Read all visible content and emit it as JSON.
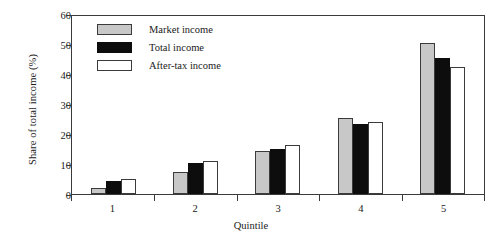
{
  "chart_data": {
    "type": "bar",
    "title": "",
    "xlabel": "Quintile",
    "ylabel": "Share of total income (%)",
    "categories": [
      "1",
      "2",
      "3",
      "4",
      "5"
    ],
    "series": [
      {
        "name": "Market income",
        "color": "#c8c8c8",
        "values": [
          2.0,
          7.3,
          14.5,
          25.5,
          50.3
        ]
      },
      {
        "name": "Total income",
        "color": "#0d0d0d",
        "values": [
          4.5,
          10.3,
          15.0,
          23.5,
          45.5
        ]
      },
      {
        "name": "After-tax income",
        "color": "#ffffff",
        "values": [
          5.0,
          11.0,
          16.2,
          24.0,
          42.5
        ]
      }
    ],
    "ylim": [
      0,
      60
    ],
    "yticks": [
      "0",
      "10",
      "20",
      "30",
      "40",
      "50",
      "60"
    ],
    "grid": false,
    "legend_position": "top-left-inside"
  },
  "axes": {
    "y_title": "Share of total income (%)",
    "x_title": "Quintile",
    "y_tick_labels": [
      "60",
      "50",
      "40",
      "30",
      "20",
      "10",
      "0"
    ],
    "x_tick_labels": [
      "1",
      "2",
      "3",
      "4",
      "5"
    ]
  },
  "legend": {
    "items": [
      {
        "label": "Market income",
        "swatch": "gray-swatch"
      },
      {
        "label": "Total income",
        "swatch": "black-swatch"
      },
      {
        "label": "After-tax income",
        "swatch": "white-swatch"
      }
    ]
  }
}
